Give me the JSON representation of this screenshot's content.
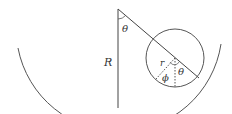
{
  "diagram": {
    "stroke_color": "#555555",
    "labels": {
      "theta_top": "θ",
      "R": "R",
      "r": "r",
      "phi": "ϕ",
      "theta_small": "θ"
    }
  }
}
